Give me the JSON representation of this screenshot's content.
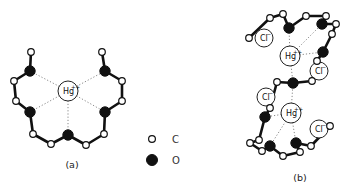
{
  "figure": {
    "panels": [
      {
        "id": "a",
        "label": "(a)",
        "label_pos": [
          72,
          168
        ],
        "ions": [
          {
            "symbol": "Hg",
            "charge": "++",
            "x": 68,
            "y": 91,
            "r": 10
          }
        ],
        "atoms": [
          {
            "el": "C",
            "x": 31,
            "y": 52
          },
          {
            "el": "O",
            "x": 30,
            "y": 71
          },
          {
            "el": "C",
            "x": 14,
            "y": 81
          },
          {
            "el": "C",
            "x": 16,
            "y": 101
          },
          {
            "el": "O",
            "x": 30,
            "y": 112
          },
          {
            "el": "C",
            "x": 33,
            "y": 134
          },
          {
            "el": "C",
            "x": 51,
            "y": 144
          },
          {
            "el": "O",
            "x": 68,
            "y": 135
          },
          {
            "el": "C",
            "x": 86,
            "y": 145
          },
          {
            "el": "C",
            "x": 104,
            "y": 134
          },
          {
            "el": "O",
            "x": 105,
            "y": 112
          },
          {
            "el": "C",
            "x": 122,
            "y": 101
          },
          {
            "el": "C",
            "x": 122,
            "y": 81
          },
          {
            "el": "O",
            "x": 105,
            "y": 71
          },
          {
            "el": "C",
            "x": 102,
            "y": 52
          }
        ],
        "bonds": [
          [
            0,
            1
          ],
          [
            1,
            2
          ],
          [
            2,
            3
          ],
          [
            3,
            4
          ],
          [
            4,
            5
          ],
          [
            5,
            6
          ],
          [
            6,
            7
          ],
          [
            7,
            8
          ],
          [
            8,
            9
          ],
          [
            9,
            10
          ],
          [
            10,
            11
          ],
          [
            11,
            12
          ],
          [
            12,
            13
          ],
          [
            13,
            14
          ]
        ],
        "coordination": [
          [
            0,
            1
          ],
          [
            0,
            4
          ],
          [
            0,
            7
          ],
          [
            0,
            10
          ],
          [
            0,
            13
          ]
        ]
      },
      {
        "id": "b",
        "label": "(b)",
        "label_pos": [
          300,
          181
        ],
        "ions": [
          {
            "symbol": "Hg",
            "charge": "++",
            "x": 290,
            "y": 56,
            "r": 10
          },
          {
            "symbol": "Hg",
            "charge": "++",
            "x": 291,
            "y": 113,
            "r": 10
          },
          {
            "symbol": "Cl",
            "charge": "−",
            "x": 264,
            "y": 38,
            "r": 9
          },
          {
            "symbol": "Cl",
            "charge": "−",
            "x": 319,
            "y": 71,
            "r": 9
          },
          {
            "symbol": "Cl",
            "charge": "−",
            "x": 266,
            "y": 97,
            "r": 9
          },
          {
            "symbol": "Cl",
            "charge": "−",
            "x": 319,
            "y": 129,
            "r": 9
          }
        ],
        "atoms": [
          {
            "el": "C",
            "x": 249,
            "y": 38
          },
          {
            "el": "C",
            "x": 270,
            "y": 18
          },
          {
            "el": "C",
            "x": 283,
            "y": 14
          },
          {
            "el": "O",
            "x": 289,
            "y": 28
          },
          {
            "el": "C",
            "x": 306,
            "y": 16
          },
          {
            "el": "C",
            "x": 326,
            "y": 16
          },
          {
            "el": "O",
            "x": 322,
            "y": 24
          },
          {
            "el": "C",
            "x": 336,
            "y": 24
          },
          {
            "el": "C",
            "x": 332,
            "y": 34
          },
          {
            "el": "O",
            "x": 323,
            "y": 52
          },
          {
            "el": "C",
            "x": 317,
            "y": 61
          },
          {
            "el": "C",
            "x": 312,
            "y": 81
          },
          {
            "el": "O",
            "x": 293,
            "y": 83
          },
          {
            "el": "C",
            "x": 277,
            "y": 82
          },
          {
            "el": "C",
            "x": 270,
            "y": 108
          },
          {
            "el": "O",
            "x": 265,
            "y": 117
          },
          {
            "el": "C",
            "x": 259,
            "y": 140
          },
          {
            "el": "C",
            "x": 250,
            "y": 143
          },
          {
            "el": "C",
            "x": 262,
            "y": 151
          },
          {
            "el": "O",
            "x": 270,
            "y": 146
          },
          {
            "el": "C",
            "x": 283,
            "y": 156
          },
          {
            "el": "C",
            "x": 300,
            "y": 152
          },
          {
            "el": "O",
            "x": 296,
            "y": 143
          },
          {
            "el": "C",
            "x": 311,
            "y": 146
          },
          {
            "el": "C",
            "x": 330,
            "y": 126
          }
        ],
        "bonds": [
          [
            0,
            1
          ],
          [
            1,
            2
          ],
          [
            2,
            3
          ],
          [
            3,
            4
          ],
          [
            4,
            5
          ],
          [
            5,
            6
          ],
          [
            6,
            7
          ],
          [
            7,
            8
          ],
          [
            8,
            9
          ],
          [
            9,
            10
          ],
          [
            10,
            11
          ],
          [
            11,
            12
          ],
          [
            12,
            13
          ],
          [
            13,
            14
          ],
          [
            14,
            15
          ],
          [
            15,
            16
          ],
          [
            16,
            17
          ],
          [
            17,
            18
          ],
          [
            18,
            19
          ],
          [
            19,
            20
          ],
          [
            20,
            21
          ],
          [
            21,
            22
          ],
          [
            22,
            23
          ],
          [
            23,
            24
          ]
        ],
        "coordination": [
          [
            0,
            3
          ],
          [
            0,
            6
          ],
          [
            0,
            9
          ],
          [
            0,
            12
          ],
          [
            1,
            12
          ],
          [
            1,
            15
          ],
          [
            1,
            19
          ],
          [
            1,
            22
          ]
        ]
      }
    ],
    "legend": {
      "items": [
        {
          "symbol": "open-circle",
          "label": "C",
          "x": 152,
          "y": 139
        },
        {
          "symbol": "filled-circle",
          "label": "O",
          "x": 152,
          "y": 160
        }
      ]
    }
  }
}
